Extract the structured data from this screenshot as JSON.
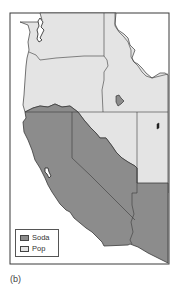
{
  "figure": {
    "caption": "(b)",
    "colors": {
      "soda": "#8c8c8c",
      "pop": "#e4e4e4",
      "border": "#3a3a3a",
      "background": "#ffffff"
    }
  },
  "legend": {
    "items": [
      {
        "label": "Soda",
        "color": "#8c8c8c"
      },
      {
        "label": "Pop",
        "color": "#e4e4e4"
      }
    ]
  },
  "regions": [
    {
      "name": "Washington",
      "category": "Pop"
    },
    {
      "name": "Oregon",
      "category": "Pop"
    },
    {
      "name": "Idaho",
      "category": "Pop"
    },
    {
      "name": "Nevada (north)",
      "category": "Pop"
    },
    {
      "name": "Utah (west)",
      "category": "Pop"
    },
    {
      "name": "California",
      "category": "Soda"
    },
    {
      "name": "Nevada (south)",
      "category": "Soda"
    },
    {
      "name": "Arizona (west)",
      "category": "Soda"
    }
  ]
}
